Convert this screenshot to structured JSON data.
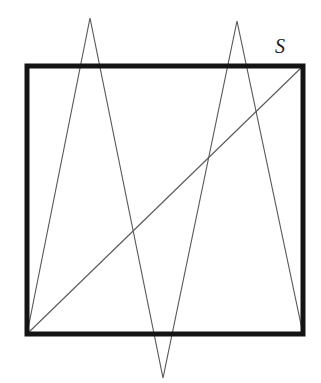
{
  "figure": {
    "label_s": "S",
    "label_s_position": {
      "x": 275,
      "y": 36
    },
    "canvas": {
      "width": 321,
      "height": 383
    },
    "background_color": "#ffffff",
    "square_stroke_color": "#141414",
    "line_stroke_color": "#5a5a5a",
    "square": {
      "name": "S",
      "stroke_width": 5,
      "corners": {
        "top_left": {
          "x": 27,
          "y": 66
        },
        "top_right": {
          "x": 303,
          "y": 66
        },
        "bottom_right": {
          "x": 303,
          "y": 334
        },
        "bottom_left": {
          "x": 27,
          "y": 334
        }
      },
      "path": "M 27 66 L 303 66 L 303 334 L 27 334 Z"
    },
    "apexes": {
      "left_top_apex": {
        "x": 90,
        "y": 18
      },
      "right_top_apex": {
        "x": 237,
        "y": 21
      },
      "bottom_apex": {
        "x": 163,
        "y": 378
      }
    },
    "zigzag_polyline": {
      "stroke_width": 1.15,
      "points": [
        {
          "x": 27,
          "y": 334
        },
        {
          "x": 90,
          "y": 18
        },
        {
          "x": 163,
          "y": 378
        },
        {
          "x": 237,
          "y": 21
        },
        {
          "x": 303,
          "y": 334
        }
      ],
      "path": "M 27 334 L 90 18 L 163 378 L 237 21 L 303 334"
    },
    "diagonal": {
      "stroke_width": 1.15,
      "from": {
        "x": 27,
        "y": 334
      },
      "to": {
        "x": 303,
        "y": 66
      },
      "path": "M 27 334 L 303 66"
    },
    "edge_crossings": {
      "top_edge": [
        80,
        99,
        228,
        245
      ],
      "bottom_edge": [
        155,
        173
      ]
    }
  }
}
